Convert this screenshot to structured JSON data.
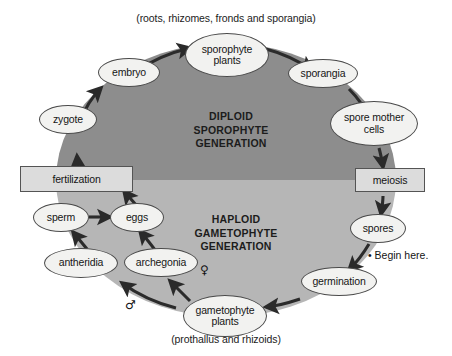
{
  "diagram": {
    "top_caption": "(roots, rhizomes, fronds and sporangia)",
    "bottom_caption": "(prothallus and rhizoids)",
    "begin_marker": "• Begin here.",
    "generations": {
      "diploid": {
        "line1": "DIPLOID",
        "line2": "SPOROPHYTE",
        "line3": "GENERATION"
      },
      "haploid": {
        "line1": "HAPLOID",
        "line2": "GAMETOPHYTE",
        "line3": "GENERATION"
      }
    },
    "symbols": {
      "female": "♀",
      "male": "♂"
    },
    "colors": {
      "diploid_fill": "#8d8d8d",
      "haploid_fill": "#b6b6b6",
      "node_fill": "#f2f2f0",
      "box_fill": "#dcdcdc",
      "outline": "#4a4a4a",
      "text": "#161616",
      "background": "#ffffff"
    },
    "nodes": [
      {
        "id": "sporophyte-plants",
        "label_line1": "sporophyte",
        "label_line2": "plants"
      },
      {
        "id": "embryo",
        "label_line1": "embryo",
        "label_line2": ""
      },
      {
        "id": "zygote",
        "label_line1": "zygote",
        "label_line2": ""
      },
      {
        "id": "sporangia",
        "label_line1": "sporangia",
        "label_line2": ""
      },
      {
        "id": "spore-mother-cells",
        "label_line1": "spore mother",
        "label_line2": "cells"
      },
      {
        "id": "spores",
        "label_line1": "spores",
        "label_line2": ""
      },
      {
        "id": "germination",
        "label_line1": "germination",
        "label_line2": ""
      },
      {
        "id": "gametophyte-plants",
        "label_line1": "gametophyte",
        "label_line2": "plants"
      },
      {
        "id": "archegonia",
        "label_line1": "archegonia",
        "label_line2": ""
      },
      {
        "id": "antheridia",
        "label_line1": "antheridia",
        "label_line2": ""
      },
      {
        "id": "eggs",
        "label_line1": "eggs",
        "label_line2": ""
      },
      {
        "id": "sperm",
        "label_line1": "sperm",
        "label_line2": ""
      }
    ],
    "process_boxes": [
      {
        "id": "fertilization",
        "label": "fertilization"
      },
      {
        "id": "meiosis",
        "label": "meiosis"
      }
    ]
  }
}
